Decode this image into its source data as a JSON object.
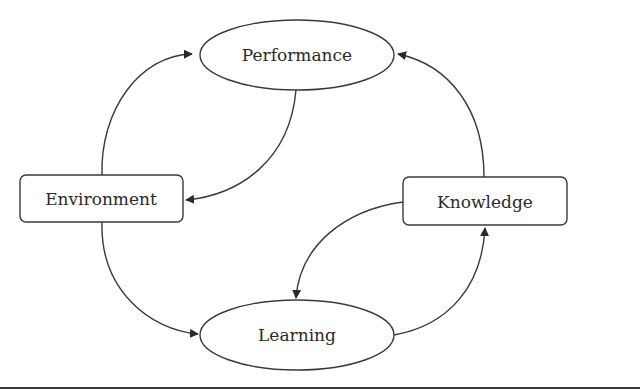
{
  "diagram": {
    "nodes": {
      "performance": {
        "label": "Performance",
        "shape": "ellipse"
      },
      "environment": {
        "label": "Environment",
        "shape": "rounded-rect"
      },
      "knowledge": {
        "label": "Knowledge",
        "shape": "rounded-rect"
      },
      "learning": {
        "label": "Learning",
        "shape": "ellipse"
      }
    },
    "edges": [
      {
        "from": "environment",
        "to": "performance"
      },
      {
        "from": "performance",
        "to": "environment"
      },
      {
        "from": "knowledge",
        "to": "performance"
      },
      {
        "from": "environment",
        "to": "learning"
      },
      {
        "from": "knowledge",
        "to": "learning"
      },
      {
        "from": "learning",
        "to": "knowledge"
      }
    ],
    "colors": {
      "stroke": "#3a3a3a",
      "text": "#2a2a2a",
      "background": "#ffffff"
    }
  }
}
